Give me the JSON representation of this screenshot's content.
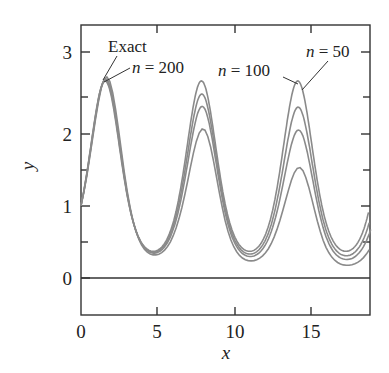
{
  "chart_data": {
    "type": "line",
    "title": "",
    "xlabel": "x",
    "ylabel": "y",
    "xlim": [
      0,
      18.8
    ],
    "ylim": [
      -0.8,
      3.5
    ],
    "xticks": [
      0,
      5,
      10,
      15
    ],
    "yticks": [
      0,
      1,
      2,
      3
    ],
    "xtick_labels": [
      "0",
      "5",
      "10",
      "15"
    ],
    "ytick_labels": [
      "0",
      "1",
      "2",
      "3"
    ],
    "grid": false,
    "legend": null,
    "series": [
      {
        "name": "Exact",
        "function": "y = e^{sin x}",
        "peak": 2.72,
        "trough": 0.37
      },
      {
        "name": "n = 200",
        "peak": 2.68
      },
      {
        "name": "n = 100",
        "peak": 2.65
      },
      {
        "name": "n = 50",
        "peak": 2.58
      }
    ],
    "annotations": [
      {
        "text": "Exact",
        "points_to": [
          1.6,
          2.72
        ]
      },
      {
        "text": "n = 200",
        "points_to": [
          1.6,
          2.68
        ]
      },
      {
        "text": "n = 100",
        "points_to": [
          14.1,
          2.65
        ]
      },
      {
        "text": "n = 50",
        "points_to": [
          14.1,
          2.58
        ]
      }
    ],
    "reference_line": {
      "y": 0
    }
  },
  "labels": {
    "exact": "Exact",
    "n200": "= 200",
    "n100": "= 100",
    "n50": "= 50",
    "n": "n",
    "x": "x",
    "y": "y",
    "t0": "0",
    "t5": "5",
    "t10": "10",
    "t15": "15",
    "y0": "0",
    "y1": "1",
    "y2": "2",
    "y3": "3"
  }
}
